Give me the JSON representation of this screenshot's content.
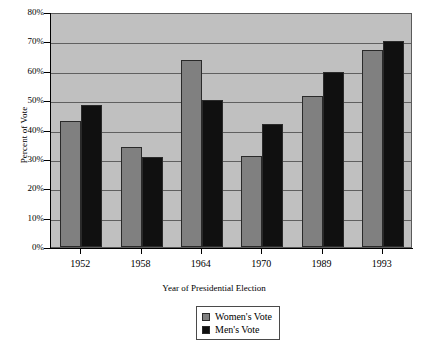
{
  "chart_data": {
    "type": "bar",
    "title": "",
    "xlabel": "Year of Presidential Election",
    "ylabel": "Percent of Vote",
    "categories": [
      "1952",
      "1958",
      "1964",
      "1970",
      "1989",
      "1993"
    ],
    "series": [
      {
        "name": "Women's Vote",
        "color": "#808080",
        "values": [
          43,
          34,
          63.5,
          31,
          51.5,
          67
        ]
      },
      {
        "name": "Men's Vote",
        "color": "#101010",
        "values": [
          48.5,
          30.5,
          50,
          42,
          59.5,
          70
        ]
      }
    ],
    "ylim": [
      0,
      80
    ],
    "ytick_labels": [
      "0%",
      "10%",
      "20%",
      "30%",
      "40%",
      "50%",
      "60%",
      "70%",
      "80%"
    ],
    "ytick_values": [
      0,
      10,
      20,
      30,
      40,
      50,
      60,
      70,
      80
    ],
    "grid": true,
    "legend_position": "bottom-center",
    "plot_background": "#c0c0c0"
  }
}
